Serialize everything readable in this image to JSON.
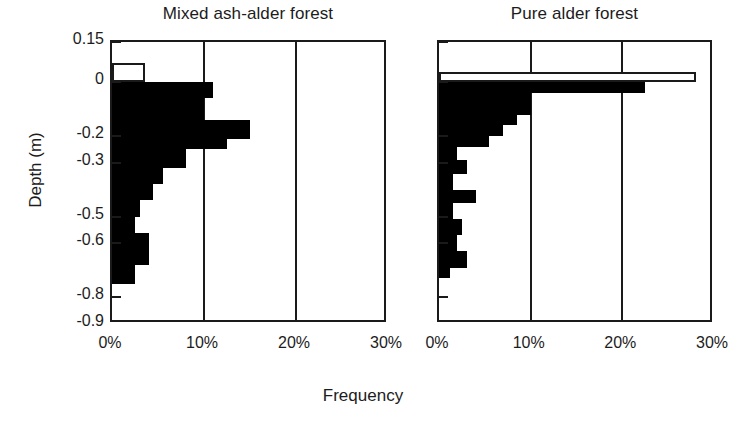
{
  "figure": {
    "xaxis_title": "Frequency",
    "yaxis_title": "Depth (m)"
  },
  "chart_data": [
    {
      "type": "bar",
      "orientation": "horizontal",
      "title": "Mixed ash-alder forest",
      "xlabel": "Frequency",
      "ylabel": "Depth (m)",
      "xlim": [
        0,
        30
      ],
      "xticks": [
        "0%",
        "10%",
        "20%",
        "30%"
      ],
      "xtick_values": [
        0,
        10,
        20,
        30
      ],
      "gridlines_x": [
        10,
        20
      ],
      "grid": true,
      "legend": "none",
      "ytick_labels": [
        "0.15",
        "0",
        "-0.2",
        "-0.3",
        "-0.5",
        "-0.6",
        "-0.8",
        "-0.9"
      ],
      "ytick_values": [
        0.15,
        0,
        -0.2,
        -0.3,
        -0.5,
        -0.6,
        -0.8,
        -0.9
      ],
      "bar_fill_solid": "#000000",
      "bar_fill_hollow": "#ffffff",
      "bars": [
        {
          "depth_top": 0.07,
          "depth_bottom": 0.0,
          "value": 3.6,
          "style": "hollow"
        },
        {
          "depth_top": 0.0,
          "depth_bottom": -0.03,
          "value": 11.0,
          "style": "solid"
        },
        {
          "depth_top": -0.03,
          "depth_bottom": -0.06,
          "value": 11.0,
          "style": "solid"
        },
        {
          "depth_top": -0.06,
          "depth_bottom": -0.1,
          "value": 10.0,
          "style": "solid"
        },
        {
          "depth_top": -0.1,
          "depth_bottom": -0.14,
          "value": 10.0,
          "style": "solid"
        },
        {
          "depth_top": -0.14,
          "depth_bottom": -0.17,
          "value": 15.0,
          "style": "solid"
        },
        {
          "depth_top": -0.17,
          "depth_bottom": -0.21,
          "value": 15.0,
          "style": "solid"
        },
        {
          "depth_top": -0.21,
          "depth_bottom": -0.25,
          "value": 12.5,
          "style": "solid"
        },
        {
          "depth_top": -0.25,
          "depth_bottom": -0.28,
          "value": 8.0,
          "style": "solid"
        },
        {
          "depth_top": -0.28,
          "depth_bottom": -0.32,
          "value": 8.0,
          "style": "solid"
        },
        {
          "depth_top": -0.32,
          "depth_bottom": -0.38,
          "value": 5.5,
          "style": "solid"
        },
        {
          "depth_top": -0.38,
          "depth_bottom": -0.44,
          "value": 4.5,
          "style": "solid"
        },
        {
          "depth_top": -0.44,
          "depth_bottom": -0.5,
          "value": 3.0,
          "style": "solid"
        },
        {
          "depth_top": -0.5,
          "depth_bottom": -0.56,
          "value": 2.5,
          "style": "solid"
        },
        {
          "depth_top": -0.56,
          "depth_bottom": -0.62,
          "value": 4.0,
          "style": "solid"
        },
        {
          "depth_top": -0.62,
          "depth_bottom": -0.68,
          "value": 4.0,
          "style": "solid"
        },
        {
          "depth_top": -0.68,
          "depth_bottom": -0.75,
          "value": 2.5,
          "style": "solid"
        }
      ]
    },
    {
      "type": "bar",
      "orientation": "horizontal",
      "title": "Pure alder forest",
      "xlabel": "Frequency",
      "ylabel": "Depth (m)",
      "xlim": [
        0,
        30
      ],
      "xticks": [
        "0%",
        "10%",
        "20%",
        "30%"
      ],
      "xtick_values": [
        0,
        10,
        20,
        30
      ],
      "gridlines_x": [
        10,
        20
      ],
      "grid": true,
      "legend": "none",
      "ytick_labels": [
        "0.15",
        "0",
        "-0.2",
        "-0.3",
        "-0.5",
        "-0.6",
        "-0.8",
        "-0.9"
      ],
      "ytick_values": [
        0.15,
        0,
        -0.2,
        -0.3,
        -0.5,
        -0.6,
        -0.8,
        -0.9
      ],
      "bar_fill_solid": "#000000",
      "bar_fill_hollow": "#ffffff",
      "bars": [
        {
          "depth_top": 0.04,
          "depth_bottom": 0.0,
          "value": 28.0,
          "style": "hollow"
        },
        {
          "depth_top": 0.0,
          "depth_bottom": -0.04,
          "value": 22.5,
          "style": "solid"
        },
        {
          "depth_top": -0.04,
          "depth_bottom": -0.12,
          "value": 10.0,
          "style": "solid"
        },
        {
          "depth_top": -0.12,
          "depth_bottom": -0.16,
          "value": 8.5,
          "style": "solid"
        },
        {
          "depth_top": -0.16,
          "depth_bottom": -0.2,
          "value": 7.0,
          "style": "solid"
        },
        {
          "depth_top": -0.2,
          "depth_bottom": -0.24,
          "value": 5.5,
          "style": "solid"
        },
        {
          "depth_top": -0.24,
          "depth_bottom": -0.29,
          "value": 2.0,
          "style": "solid"
        },
        {
          "depth_top": -0.29,
          "depth_bottom": -0.34,
          "value": 3.0,
          "style": "solid"
        },
        {
          "depth_top": -0.34,
          "depth_bottom": -0.4,
          "value": 1.5,
          "style": "solid"
        },
        {
          "depth_top": -0.4,
          "depth_bottom": -0.45,
          "value": 4.0,
          "style": "solid"
        },
        {
          "depth_top": -0.45,
          "depth_bottom": -0.51,
          "value": 1.5,
          "style": "solid"
        },
        {
          "depth_top": -0.51,
          "depth_bottom": -0.57,
          "value": 2.5,
          "style": "solid"
        },
        {
          "depth_top": -0.57,
          "depth_bottom": -0.63,
          "value": 2.0,
          "style": "solid"
        },
        {
          "depth_top": -0.63,
          "depth_bottom": -0.69,
          "value": 3.0,
          "style": "solid"
        },
        {
          "depth_top": -0.69,
          "depth_bottom": -0.73,
          "value": 1.2,
          "style": "solid"
        }
      ]
    }
  ],
  "panels": [
    {
      "id": "left",
      "title": "Mixed ash-alder forest",
      "x_tick_labels": [
        "0%",
        "10%",
        "20%",
        "30%"
      ],
      "y_tick_labels": [
        "0.15",
        "0",
        "-0.2",
        "-0.3",
        "-0.5",
        "-0.6",
        "-0.8",
        "-0.9"
      ]
    },
    {
      "id": "right",
      "title": "Pure alder forest",
      "x_tick_labels": [
        "0%",
        "10%",
        "20%",
        "30%"
      ],
      "y_tick_labels": [
        "0.15",
        "0",
        "-0.2",
        "-0.3",
        "-0.5",
        "-0.6",
        "-0.8",
        "-0.9"
      ]
    }
  ]
}
